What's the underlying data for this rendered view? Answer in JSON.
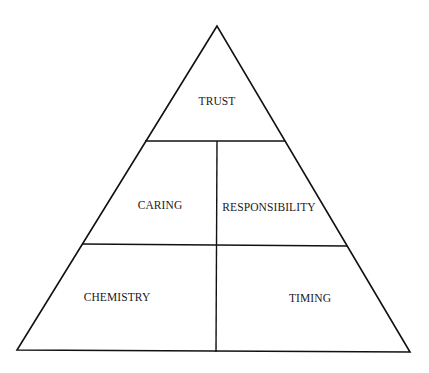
{
  "diagram": {
    "type": "pyramid",
    "line_color": "#111111",
    "background": "#ffffff",
    "tiers": [
      {
        "level": 1,
        "cells": [
          {
            "label": "TRUST"
          }
        ]
      },
      {
        "level": 2,
        "cells": [
          {
            "label": "CARING"
          },
          {
            "label": "RESPONSIBILITY"
          }
        ]
      },
      {
        "level": 3,
        "cells": [
          {
            "label": "CHEMISTRY"
          },
          {
            "label": "TIMING"
          }
        ]
      }
    ]
  }
}
